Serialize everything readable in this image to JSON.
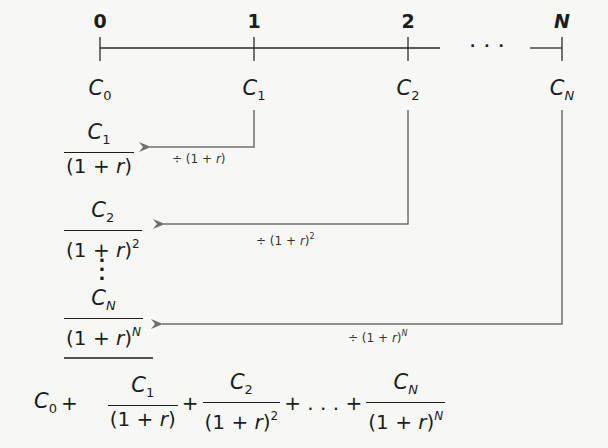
{
  "diagram": {
    "type": "present-value-timeline",
    "timeline": {
      "periods": [
        {
          "label": "0",
          "italic": false
        },
        {
          "label": "1",
          "italic": false
        },
        {
          "label": "2",
          "italic": false
        },
        {
          "label": "N",
          "italic": true
        }
      ],
      "ellipsis": "· · ·",
      "cash_flows": [
        {
          "base": "C",
          "sub": "0"
        },
        {
          "base": "C",
          "sub": "1"
        },
        {
          "base": "C",
          "sub": "2"
        },
        {
          "base": "C",
          "sub": "N"
        }
      ]
    },
    "discounted_terms": [
      {
        "num_base": "C",
        "num_sub": "1",
        "den_open": "(1 + ",
        "den_r": "r",
        "den_close": ")",
        "den_exp": ""
      },
      {
        "num_base": "C",
        "num_sub": "2",
        "den_open": "(1 + ",
        "den_r": "r",
        "den_close": ")",
        "den_exp": "2"
      },
      {
        "num_base": "C",
        "num_sub": "N",
        "den_open": "(1 + ",
        "den_r": "r",
        "den_close": ")",
        "den_exp": "N"
      }
    ],
    "arrow_labels": [
      {
        "prefix": "÷ (1 + ",
        "r": "r",
        "suffix": ")",
        "exp": ""
      },
      {
        "prefix": "÷ (1 + ",
        "r": "r",
        "suffix": ")",
        "exp": "2"
      },
      {
        "prefix": "÷ (1 + ",
        "r": "r",
        "suffix": ")",
        "exp": "N"
      }
    ],
    "vertical_ellipsis": [
      "·",
      "·",
      "·"
    ],
    "sum_equation": {
      "first": {
        "base": "C",
        "sub": "0"
      },
      "plus": "+",
      "ellipsis": "+ . . . +",
      "terms": [
        {
          "num_base": "C",
          "num_sub": "1",
          "den_open": "(1 + ",
          "den_r": "r",
          "den_close": ")",
          "den_exp": ""
        },
        {
          "num_base": "C",
          "num_sub": "2",
          "den_open": "(1 + ",
          "den_r": "r",
          "den_close": ")",
          "den_exp": "2"
        },
        {
          "num_base": "C",
          "num_sub": "N",
          "den_open": "(1 + ",
          "den_r": "r",
          "den_close": ")",
          "den_exp": "N"
        }
      ]
    },
    "colors": {
      "ink": "#1c1c1c",
      "arrow_lines": "#6e6e6e",
      "background": "#f7f8f6"
    }
  }
}
